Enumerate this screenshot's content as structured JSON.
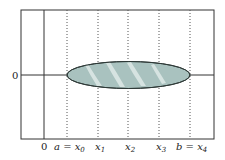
{
  "diagram": {
    "y_axis_label": "0",
    "x_labels": [
      {
        "text": "0",
        "x": 44
      },
      {
        "text": "a = x",
        "sub": "0",
        "x": 67
      },
      {
        "text": "x",
        "sub": "1",
        "x": 98
      },
      {
        "text": "x",
        "sub": "2",
        "x": 128
      },
      {
        "text": "x",
        "sub": "3",
        "x": 159
      },
      {
        "text": "b = x",
        "sub": "4",
        "x": 190
      }
    ],
    "colors": {
      "fill": "#a9c2bf",
      "stroke": "#2f3a38",
      "highlight": "#dfe9e7"
    }
  }
}
